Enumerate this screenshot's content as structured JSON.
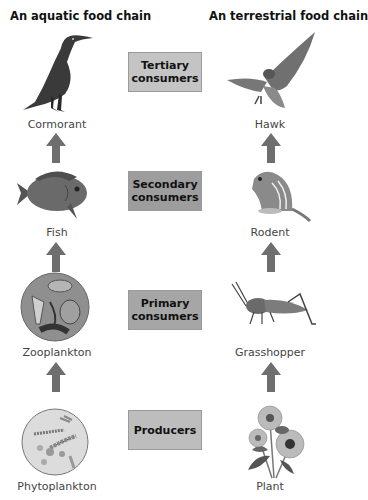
{
  "columns": {
    "aquatic": {
      "title": "An aquatic food chain",
      "organisms": [
        {
          "level": "tertiary",
          "name": "Cormorant",
          "icon": "cormorant-illustration"
        },
        {
          "level": "secondary",
          "name": "Fish",
          "icon": "fish-illustration"
        },
        {
          "level": "primary",
          "name": "Zooplankton",
          "icon": "zooplankton-illustration"
        },
        {
          "level": "producer",
          "name": "Phytoplankton",
          "icon": "phytoplankton-illustration"
        }
      ]
    },
    "terrestrial": {
      "title": "An terrestrial food chain",
      "organisms": [
        {
          "level": "tertiary",
          "name": "Hawk",
          "icon": "hawk-illustration"
        },
        {
          "level": "secondary",
          "name": "Rodent",
          "icon": "rodent-illustration"
        },
        {
          "level": "primary",
          "name": "Grasshopper",
          "icon": "grasshopper-illustration"
        },
        {
          "level": "producer",
          "name": "Plant",
          "icon": "plant-illustration"
        }
      ]
    }
  },
  "levels": [
    {
      "id": "tertiary",
      "line1": "Tertiary",
      "line2": "consumers",
      "color": "#c4c4c4"
    },
    {
      "id": "secondary",
      "line1": "Secondary",
      "line2": "consumers",
      "color": "#9d9d9d"
    },
    {
      "id": "primary",
      "line1": "Primary",
      "line2": "consumers",
      "color": "#a6a6a6"
    },
    {
      "id": "producer",
      "line1": "Producers",
      "line2": "",
      "color": "#bdbdbd"
    }
  ],
  "colors": {
    "arrow": "#6e6e6e",
    "background": "#ffffff"
  }
}
